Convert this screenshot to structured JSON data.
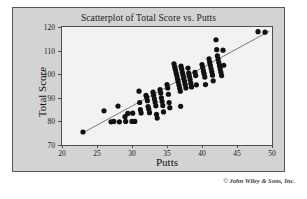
{
  "figure": {
    "copyright": "© John Wiley & Sons, Inc."
  },
  "chart_data": {
    "type": "scatter",
    "title": "Scatterplot of Total Score vs. Putts",
    "xlabel": "Putts",
    "ylabel": "Total Score",
    "xlim": [
      20,
      50
    ],
    "ylim": [
      70,
      120
    ],
    "xticks": [
      20,
      25,
      30,
      35,
      40,
      45,
      50
    ],
    "yticks": [
      70,
      80,
      90,
      100,
      110,
      120
    ],
    "xtick_labels": [
      "20",
      "25",
      "30",
      "35",
      "40",
      "45",
      "50"
    ],
    "ytick_labels": [
      "70",
      "80",
      "90",
      "100",
      "110",
      "120"
    ],
    "grid": false,
    "legend": null,
    "marker": {
      "shape": "circle",
      "color": "#111111",
      "size": 2.6
    },
    "fit_line": {
      "type": "linear-regression",
      "color": "#6b6b6b",
      "x_start": 23.0,
      "y_start": 75.2,
      "x_end": 49.6,
      "y_end": 118.2
    },
    "points": [
      [
        23.0,
        75.5
      ],
      [
        26.0,
        84.5
      ],
      [
        27.0,
        79.8
      ],
      [
        27.4,
        80.0
      ],
      [
        28.0,
        86.5
      ],
      [
        28.2,
        79.8
      ],
      [
        29.0,
        82.0
      ],
      [
        29.1,
        80.0
      ],
      [
        29.4,
        83.4
      ],
      [
        30.0,
        80.0
      ],
      [
        30.1,
        83.5
      ],
      [
        30.4,
        80.0
      ],
      [
        31.0,
        92.8
      ],
      [
        31.1,
        88.0
      ],
      [
        31.2,
        85.0
      ],
      [
        31.3,
        83.6
      ],
      [
        32.0,
        91.0
      ],
      [
        32.1,
        90.2
      ],
      [
        32.2,
        88.8
      ],
      [
        32.3,
        86.3
      ],
      [
        32.4,
        85.2
      ],
      [
        32.5,
        83.7
      ],
      [
        33.0,
        92.4
      ],
      [
        33.1,
        91.0
      ],
      [
        33.2,
        89.6
      ],
      [
        33.3,
        88.2
      ],
      [
        33.4,
        86.6
      ],
      [
        33.5,
        83.0
      ],
      [
        33.6,
        81.4
      ],
      [
        34.0,
        93.5
      ],
      [
        34.1,
        92.0
      ],
      [
        34.2,
        90.0
      ],
      [
        34.3,
        88.4
      ],
      [
        34.4,
        86.7
      ],
      [
        34.5,
        84.0
      ],
      [
        35.0,
        95.6
      ],
      [
        35.1,
        94.2
      ],
      [
        35.2,
        91.5
      ],
      [
        35.3,
        88.0
      ],
      [
        35.4,
        85.8
      ],
      [
        36.0,
        104.4
      ],
      [
        36.1,
        103.1
      ],
      [
        36.2,
        102.0
      ],
      [
        36.3,
        100.6
      ],
      [
        36.4,
        99.4
      ],
      [
        36.5,
        98.0
      ],
      [
        36.6,
        96.8
      ],
      [
        36.7,
        95.4
      ],
      [
        36.8,
        94.1
      ],
      [
        36.9,
        92.8
      ],
      [
        36.95,
        86.4
      ],
      [
        37.0,
        103.4
      ],
      [
        37.1,
        102.2
      ],
      [
        37.2,
        100.8
      ],
      [
        37.3,
        99.6
      ],
      [
        37.4,
        98.2
      ],
      [
        37.5,
        96.9
      ],
      [
        37.6,
        95.6
      ],
      [
        37.7,
        94.2
      ],
      [
        38.0,
        102.6
      ],
      [
        38.1,
        100.5
      ],
      [
        38.2,
        99.2
      ],
      [
        38.3,
        97.8
      ],
      [
        38.4,
        96.2
      ],
      [
        38.5,
        94.6
      ],
      [
        39.0,
        100.8
      ],
      [
        39.1,
        99.4
      ],
      [
        39.2,
        95.5
      ],
      [
        40.0,
        104.1
      ],
      [
        40.1,
        102.8
      ],
      [
        40.2,
        101.4
      ],
      [
        40.3,
        100.2
      ],
      [
        40.4,
        98.8
      ],
      [
        40.5,
        95.6
      ],
      [
        41.0,
        106.5
      ],
      [
        41.1,
        105.1
      ],
      [
        41.2,
        103.8
      ],
      [
        41.3,
        102.4
      ],
      [
        41.4,
        101.0
      ],
      [
        41.5,
        99.6
      ],
      [
        41.6,
        97.2
      ],
      [
        42.0,
        114.6
      ],
      [
        42.1,
        110.4
      ],
      [
        42.2,
        107.8
      ],
      [
        42.3,
        106.4
      ],
      [
        42.4,
        105.0
      ],
      [
        42.5,
        103.6
      ],
      [
        42.6,
        102.2
      ],
      [
        42.7,
        100.8
      ],
      [
        42.8,
        99.4
      ],
      [
        43.0,
        110.2
      ],
      [
        43.1,
        103.8
      ],
      [
        48.0,
        118.0
      ],
      [
        49.0,
        117.8
      ]
    ]
  }
}
